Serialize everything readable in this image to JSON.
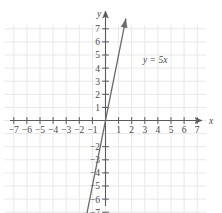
{
  "chart_data": {
    "type": "line",
    "title": "",
    "xlabel": "x",
    "ylabel": "y",
    "xlim": [
      -8.2,
      8.2
    ],
    "ylim": [
      -8.2,
      8.2
    ],
    "grid": true,
    "grid_color": "#e8e8ea",
    "axis_color": "#5a5a5a",
    "line_color": "#6b6b6b",
    "legend": "none",
    "x_ticks": [
      -7,
      -6,
      -5,
      -4,
      -3,
      -2,
      -1,
      1,
      2,
      3,
      4,
      5,
      6,
      7
    ],
    "y_ticks": [
      7,
      6,
      5,
      4,
      3,
      2,
      1,
      -2,
      -3,
      -4,
      -5,
      -6,
      -7
    ],
    "x_tick_labels": [
      "−7",
      "−6",
      "−5",
      "−4",
      "−3",
      "−2",
      "−1",
      "1",
      "2",
      "3",
      "4",
      "5",
      "6",
      "7"
    ],
    "y_tick_labels": [
      "7",
      "6",
      "5",
      "4",
      "3",
      "2",
      "1",
      "−2",
      "−3",
      "−4",
      "−5",
      "−6",
      "−7"
    ],
    "series": [
      {
        "name": "y = 5x",
        "equation": "y = 5x",
        "slope": 5,
        "intercept": 0,
        "arrows": "both",
        "points": [
          [
            -1.55,
            -7.75
          ],
          [
            1.55,
            7.75
          ]
        ]
      }
    ],
    "annotations": [
      {
        "text": "y = 5x",
        "x": 2.9,
        "y": 4.45
      }
    ]
  },
  "axes": {
    "x_label": "x",
    "y_label": "y"
  }
}
